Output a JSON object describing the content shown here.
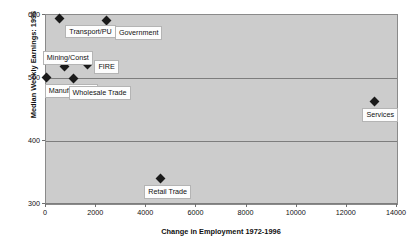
{
  "chart_data": {
    "type": "scatter",
    "title": "",
    "xlabel": "Change in Employment 1972-1996",
    "ylabel": "Median Weekly Earnings: 1996",
    "xlim": [
      0,
      14000
    ],
    "ylim": [
      300,
      600
    ],
    "xticks": [
      0,
      2000,
      4000,
      6000,
      8000,
      10000,
      12000,
      14000
    ],
    "yticks": [
      300,
      400,
      500,
      600
    ],
    "xtick_labels": [
      "0",
      "2000",
      "4000",
      "6000",
      "8000",
      "10000",
      "12000",
      "14000"
    ],
    "ytick_labels": [
      "300",
      "400",
      "500",
      "600"
    ],
    "grid": "horizontal",
    "legend": "none",
    "marker": "diamond",
    "marker_color": "#1a1a1a",
    "plot_background": "#cccccc",
    "points": [
      {
        "label": "Transport/PU",
        "x": 530,
        "y": 594,
        "label_dx": 6,
        "label_dy": 6
      },
      {
        "label": "Government",
        "x": 2430,
        "y": 592,
        "label_dx": 8,
        "label_dy": 6
      },
      {
        "label": "Mining/Const",
        "x": 750,
        "y": 519,
        "label_dx": -22,
        "label_dy": -15
      },
      {
        "label": "FIRE",
        "x": 1655,
        "y": 522,
        "label_dx": 7,
        "label_dy": -4
      },
      {
        "label": "Manufacturing",
        "x": 30,
        "y": 501,
        "label_dx": -2,
        "label_dy": 7
      },
      {
        "label": "Wholesale Trade",
        "x": 1100,
        "y": 500,
        "label_dx": -5,
        "label_dy": 8
      },
      {
        "label": "Retail Trade",
        "x": 4560,
        "y": 340,
        "label_dx": -16,
        "label_dy": 6
      },
      {
        "label": "Services",
        "x": 13100,
        "y": 462,
        "label_dx": -12,
        "label_dy": 6
      }
    ]
  }
}
